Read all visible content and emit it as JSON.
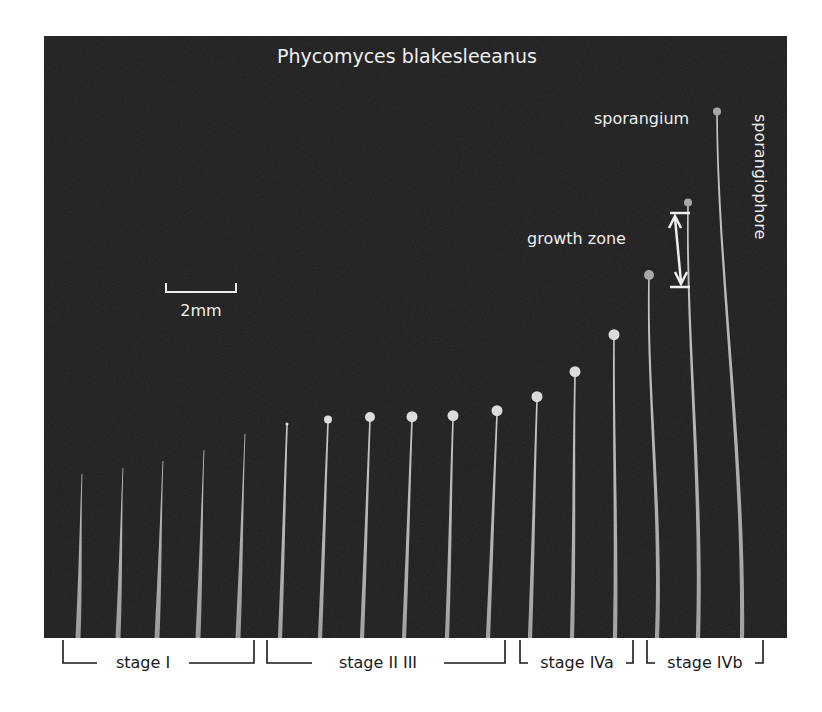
{
  "figure": {
    "title": "Phycomyces blakesleeanus",
    "colors": {
      "background": "#ffffff",
      "panel": "#1e1e1e",
      "stalk": "#c8c8c8",
      "head": "#dcdcdc",
      "label_light": "#eeeeee",
      "label_dark": "#1a1a1a"
    },
    "annotations": {
      "sporangium": "sporangium",
      "sporangiophore": "sporangiophore",
      "growth_zone": "growth zone",
      "scale_bar": "2mm"
    },
    "stages": [
      {
        "label": "stage I"
      },
      {
        "label": "stage II III"
      },
      {
        "label": "stage IVa"
      },
      {
        "label": "stage IVb"
      }
    ],
    "specimens": [
      {
        "base_x": 78,
        "tip_x": 82,
        "tip_y": 474,
        "head_r": 0,
        "stage": "I"
      },
      {
        "base_x": 118,
        "tip_x": 123,
        "tip_y": 468,
        "head_r": 0,
        "stage": "I"
      },
      {
        "base_x": 157,
        "tip_x": 163,
        "tip_y": 461,
        "head_r": 0,
        "stage": "I"
      },
      {
        "base_x": 198,
        "tip_x": 204,
        "tip_y": 450,
        "head_r": 0,
        "stage": "I"
      },
      {
        "base_x": 238,
        "tip_x": 245,
        "tip_y": 434,
        "head_r": 0,
        "stage": "I"
      },
      {
        "base_x": 280,
        "tip_x": 287,
        "tip_y": 425,
        "head_r": 1.5,
        "stage": "II III"
      },
      {
        "base_x": 320,
        "tip_x": 328,
        "tip_y": 422,
        "head_r": 4,
        "stage": "II III"
      },
      {
        "base_x": 362,
        "tip_x": 370,
        "tip_y": 420,
        "head_r": 5,
        "stage": "II III"
      },
      {
        "base_x": 404,
        "tip_x": 412,
        "tip_y": 420,
        "head_r": 5.5,
        "stage": "II III"
      },
      {
        "base_x": 447,
        "tip_x": 453,
        "tip_y": 419,
        "head_r": 5.5,
        "stage": "II III"
      },
      {
        "base_x": 488,
        "tip_x": 497,
        "tip_y": 414,
        "head_r": 5.5,
        "stage": "II III"
      },
      {
        "base_x": 530,
        "tip_x": 537,
        "tip_y": 400,
        "head_r": 5.5,
        "stage": "IVa"
      },
      {
        "base_x": 572,
        "tip_x": 575,
        "tip_y": 375,
        "head_r": 5.5,
        "stage": "IVa"
      },
      {
        "base_x": 615,
        "tip_x": 614,
        "tip_y": 338,
        "head_r": 5.5,
        "stage": "IVa"
      },
      {
        "base_x": 657,
        "tip_x": 649,
        "tip_y": 278,
        "head_r": 5,
        "stage": "IVb"
      },
      {
        "base_x": 698,
        "tip_x": 688,
        "tip_y": 205,
        "head_r": 4,
        "stage": "IVb"
      },
      {
        "base_x": 742,
        "tip_x": 717,
        "tip_y": 114,
        "head_r": 4,
        "stage": "IVb"
      }
    ]
  }
}
